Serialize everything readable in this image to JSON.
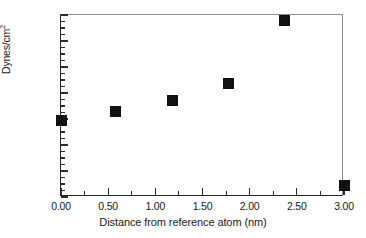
{
  "chart_data": {
    "type": "scatter",
    "title": "",
    "xlabel": "Distance from reference atom (nm)",
    "ylabel": "Dynes/cm2",
    "ylabel_base": "Dynes/cm",
    "ylabel_sup": "2",
    "xlim": [
      0.0,
      3.0
    ],
    "ylim": [
      3000,
      10000
    ],
    "grid": false,
    "legend": null,
    "marker": "filled-square",
    "marker_color": "#111111",
    "xticks": [
      0.0,
      0.5,
      1.0,
      1.5,
      2.0,
      2.5,
      3.0
    ],
    "xticklabels": [
      "0.00",
      "0.50",
      "1.00",
      "1.50",
      "2.00",
      "2.50",
      "3.00"
    ],
    "x_minor_step": 0.25,
    "yticks": [
      3000,
      4000,
      5000,
      6000,
      7000,
      8000,
      9000,
      10000
    ],
    "yticklabels": [
      "3000",
      "4000",
      "5000",
      "6000",
      "7000",
      "8000",
      "9000",
      "10000"
    ],
    "y_minor_step": 250,
    "points": [
      {
        "x": 0.0,
        "y": 5950
      },
      {
        "x": 0.58,
        "y": 6300
      },
      {
        "x": 1.18,
        "y": 6720
      },
      {
        "x": 1.78,
        "y": 7380
      },
      {
        "x": 2.37,
        "y": 9800
      },
      {
        "x": 3.0,
        "y": 3450
      }
    ]
  }
}
